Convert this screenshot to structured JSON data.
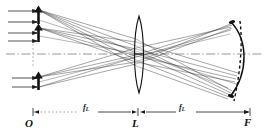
{
  "figure": {
    "kind": "optical-ray-diagram",
    "title": "",
    "background": "#ffffff",
    "ink": "#1a1a1a",
    "width": 267,
    "height": 134
  },
  "axis": {
    "name": "optical-axis",
    "style": "dash-dot",
    "y": 54,
    "x_start": 6,
    "x_end": 262
  },
  "labels": {
    "object_point": "O",
    "lens": "L",
    "focal_plane": "F",
    "distance_1_text": "f",
    "distance_1_sub": "L",
    "distance_2_text": "f",
    "distance_2_sub": "L"
  },
  "label_positions": {
    "object_point": {
      "x": 27,
      "y": 119
    },
    "lens": {
      "x": 132,
      "y": 119
    },
    "focal_plane": {
      "x": 245,
      "y": 118
    },
    "distance_1": {
      "x": 83,
      "y": 106
    },
    "distance_2": {
      "x": 179,
      "y": 106
    }
  },
  "dimension_line": {
    "name": "distance-scale",
    "y": 112,
    "x_origin": 33,
    "x_lens": 138,
    "x_focus": 250,
    "ticks": [
      33,
      138,
      250
    ],
    "arrow_at": "right"
  },
  "objects": [
    {
      "name": "object-arrow-top",
      "x": 38,
      "y_top": 8,
      "y_bottom": 24,
      "direction": "up"
    },
    {
      "name": "object-arrow-middle",
      "x": 38,
      "y_top": 26,
      "y_bottom": 42,
      "direction": "up"
    },
    {
      "name": "object-arrow-bottom",
      "x": 38,
      "y_top": 74,
      "y_bottom": 90,
      "direction": "up"
    }
  ],
  "incoming_rays": {
    "name": "incoming-parallel-rays",
    "count": 5,
    "x_start": 8,
    "x_end": 38,
    "y_values": [
      10,
      20,
      30,
      40,
      78,
      88
    ]
  },
  "lens": {
    "name": "biconvex-lens",
    "center_x": 139,
    "top_y": 16,
    "bottom_y": 93,
    "bulge": 7
  },
  "image_surface": {
    "name": "curved-image-surface",
    "style": "solid",
    "apex_x": 246,
    "top": {
      "x": 231,
      "y": 22
    },
    "bottom": {
      "x": 230,
      "y": 96
    }
  },
  "petzval_surface": {
    "name": "petzval-dashed-curve",
    "style": "dashed",
    "top": {
      "x": 240,
      "y": 21
    },
    "bottom": {
      "x": 235,
      "y": 100
    }
  },
  "ray_bundles": [
    {
      "name": "ray-bundle-upper",
      "origin": {
        "x": 38,
        "y": 11
      },
      "target": {
        "x": 232,
        "y": 92
      }
    },
    {
      "name": "ray-bundle-middle",
      "origin": {
        "x": 38,
        "y": 29
      },
      "target": {
        "x": 240,
        "y": 74
      }
    },
    {
      "name": "ray-bundle-lower",
      "origin": {
        "x": 38,
        "y": 77
      },
      "target": {
        "x": 233,
        "y": 24
      }
    }
  ]
}
